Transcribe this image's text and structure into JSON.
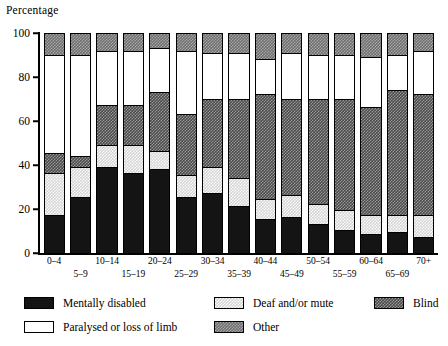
{
  "chart_data": {
    "type": "bar",
    "subtype": "stacked-bar-100",
    "title": "",
    "ylabel": "Percentage",
    "xlabel": "",
    "ylim": [
      0,
      100
    ],
    "yticks": [
      0,
      20,
      40,
      60,
      80,
      100
    ],
    "grid": false,
    "legend_position": "bottom",
    "categories": [
      "0–4",
      "5–9",
      "10–14",
      "15–19",
      "20–24",
      "25–29",
      "30–34",
      "35–39",
      "40–44",
      "45–49",
      "50–54",
      "55–59",
      "60–64",
      "65–69",
      "70+"
    ],
    "series": [
      {
        "name": "Mentally disabled",
        "fill": "f-mental",
        "values": [
          17,
          25,
          39,
          36,
          38,
          25,
          27,
          21,
          15,
          16,
          13,
          10,
          8,
          9,
          7
        ]
      },
      {
        "name": "Deaf and/or mute",
        "fill": "f-deaf",
        "values": [
          19,
          14,
          10,
          13,
          8,
          10,
          12,
          13,
          9,
          10,
          9,
          9,
          9,
          8,
          10
        ]
      },
      {
        "name": "Blind",
        "fill": "f-blind",
        "values": [
          9,
          5,
          18,
          18,
          27,
          28,
          31,
          36,
          48,
          44,
          48,
          51,
          49,
          57,
          55
        ]
      },
      {
        "name": "Paralysed or loss of limb",
        "fill": "f-paralysed",
        "values": [
          45,
          46,
          25,
          25,
          20,
          29,
          21,
          21,
          16,
          21,
          20,
          20,
          23,
          16,
          20
        ]
      },
      {
        "name": "Other",
        "fill": "f-other",
        "values": [
          10,
          10,
          8,
          8,
          7,
          8,
          9,
          9,
          12,
          9,
          10,
          10,
          11,
          10,
          8
        ]
      }
    ]
  },
  "legend": {
    "items": [
      {
        "label": "Mentally disabled",
        "fill": "f-mental"
      },
      {
        "label": "Deaf and/or mute",
        "fill": "f-deaf"
      },
      {
        "label": "Blind",
        "fill": "f-blind"
      },
      {
        "label": "Paralysed or loss of limb",
        "fill": "f-paralysed"
      },
      {
        "label": "Other",
        "fill": "f-other"
      }
    ],
    "layout": [
      {
        "left": 0,
        "top": 0
      },
      {
        "left": 190,
        "top": 0
      },
      {
        "left": 350,
        "top": 0
      },
      {
        "left": 0,
        "top": 24
      },
      {
        "left": 190,
        "top": 24
      }
    ]
  }
}
